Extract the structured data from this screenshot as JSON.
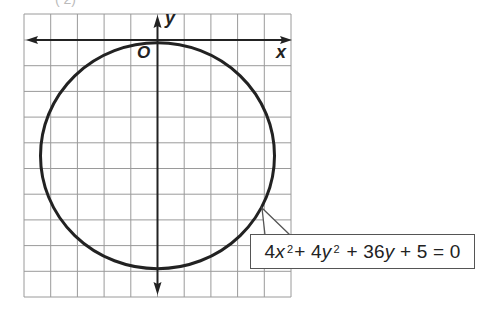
{
  "figure": {
    "title_fragment": "(     2)",
    "axes": {
      "x_label": "x",
      "y_label": "y",
      "origin_label": "O"
    },
    "grid": {
      "columns": 10,
      "rows": 11,
      "x_range": [
        -5,
        5
      ],
      "y_range": [
        -10,
        1
      ],
      "line_color": "#9a9a9a"
    },
    "circle": {
      "equation_display": "4x² + 4y² + 36y + 5 = 0",
      "equation_parts": {
        "t1_coef": "4",
        "t1_var": "x",
        "t1_exp": "2",
        "op1": "+",
        "t2_coef": "4",
        "t2_var": "y",
        "t2_exp": "2",
        "op2": "+",
        "t3_coef": "36",
        "t3_var": "y",
        "op3": "+",
        "t4": "5",
        "eq": "=",
        "rhs": "0"
      },
      "center": [
        0,
        -4.5
      ],
      "radius": 4.39,
      "stroke_color": "#222222"
    }
  }
}
